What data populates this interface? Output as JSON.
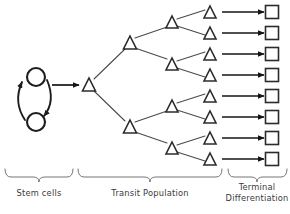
{
  "diagram": {
    "colors": {
      "shape_stroke": "#2b2b2b",
      "cycle_stroke": "#1d1d1d",
      "edge_stroke": "#4a4a4a",
      "arrow_stroke": "#141414",
      "brace_stroke": "#6e6e6e",
      "text": "#3a3a3a",
      "background": "#ffffff"
    },
    "stem_cells": {
      "shape": "circle",
      "count": 2,
      "radius": 9,
      "nodes": [
        {
          "id": "stem-cell-top",
          "cx": 36,
          "cy": 77
        },
        {
          "id": "stem-cell-bottom",
          "cx": 36,
          "cy": 122
        }
      ],
      "self_renewal_arcs": 2
    },
    "transit_population": {
      "shape": "triangle",
      "levels": [
        {
          "level": 1,
          "count": 1,
          "nodes": [
            {
              "cx": 89,
              "cy": 85
            }
          ]
        },
        {
          "level": 2,
          "count": 2,
          "nodes": [
            {
              "cx": 130,
              "cy": 43
            },
            {
              "cx": 130,
              "cy": 127
            }
          ]
        },
        {
          "level": 3,
          "count": 4,
          "nodes": [
            {
              "cx": 172,
              "cy": 22
            },
            {
              "cx": 172,
              "cy": 64
            },
            {
              "cx": 172,
              "cy": 106
            },
            {
              "cx": 172,
              "cy": 148
            }
          ]
        },
        {
          "level": 4,
          "count": 8,
          "nodes": [
            {
              "cx": 210,
              "cy": 12
            },
            {
              "cx": 210,
              "cy": 33
            },
            {
              "cx": 210,
              "cy": 54
            },
            {
              "cx": 210,
              "cy": 75
            },
            {
              "cx": 210,
              "cy": 96
            },
            {
              "cx": 210,
              "cy": 117
            },
            {
              "cx": 210,
              "cy": 138
            },
            {
              "cx": 210,
              "cy": 159
            }
          ]
        }
      ],
      "total_triangles": 15,
      "branching_factor": 2
    },
    "terminal_differentiation": {
      "shape": "square",
      "count": 8,
      "size": 13,
      "nodes": [
        {
          "cx": 272,
          "cy": 12
        },
        {
          "cx": 272,
          "cy": 33
        },
        {
          "cx": 272,
          "cy": 54
        },
        {
          "cx": 272,
          "cy": 75
        },
        {
          "cx": 272,
          "cy": 96
        },
        {
          "cx": 272,
          "cy": 117
        },
        {
          "cx": 272,
          "cy": 138
        },
        {
          "cx": 272,
          "cy": 159
        }
      ],
      "arrow_count": 8
    },
    "entry_arrow": {
      "from_x": 52,
      "to_x": 78,
      "y": 85
    },
    "braces": [
      {
        "id": "brace-stem",
        "x_start": 5,
        "x_end": 73,
        "y": 172
      },
      {
        "id": "brace-transit",
        "x_start": 78,
        "x_end": 222,
        "y": 172
      },
      {
        "id": "brace-terminal",
        "x_start": 228,
        "x_end": 287,
        "y": 172
      }
    ]
  },
  "captions": {
    "stem_cells": "Stem cells",
    "transit_population": "Transit Population",
    "terminal_line1": "Terminal",
    "terminal_line2": "Differentiation"
  }
}
